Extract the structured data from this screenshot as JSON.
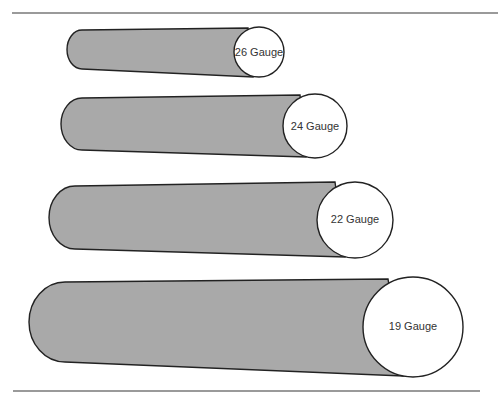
{
  "figure": {
    "needles": [
      {
        "label": "26 Gauge",
        "gauge": 26
      },
      {
        "label": "24 Gauge",
        "gauge": 24
      },
      {
        "label": "22 Gauge",
        "gauge": 22
      },
      {
        "label": "19 Gauge",
        "gauge": 19
      }
    ],
    "colors": {
      "body": "#a9a9a9",
      "end": "#ffffff",
      "outline": "#222222",
      "rule": "#9a9a9a"
    }
  }
}
